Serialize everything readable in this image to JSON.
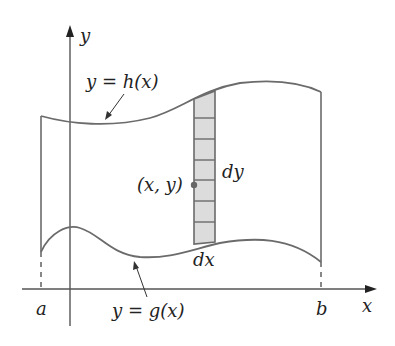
{
  "figure": {
    "axes": {
      "x_label": "x",
      "y_label": "y"
    },
    "bounds": {
      "a_label": "a",
      "b_label": "b"
    },
    "curves": {
      "upper": {
        "label": "y = h(x)",
        "name": "h(x)"
      },
      "lower": {
        "label": "y = g(x)",
        "name": "g(x)"
      }
    },
    "strip": {
      "width_label": "dx",
      "height_label": "dy",
      "point_label": "(x, y)",
      "cell_count": 8,
      "fill_color": "#dcdcdc"
    }
  }
}
